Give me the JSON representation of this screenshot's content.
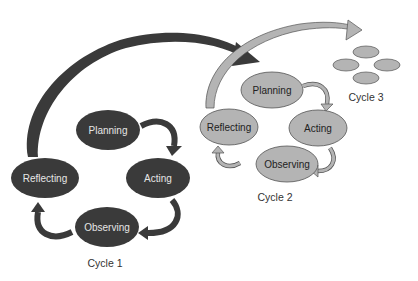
{
  "diagram": {
    "type": "action-research-spiral",
    "colors": {
      "dark_fill": "#3a3a3a",
      "dark_text": "#e6e6e6",
      "light_fill": "#b4b4b4",
      "light_stroke": "#555555",
      "light_text": "#222222",
      "arrow_dark": "#3a3a3a",
      "arrow_light": "#b4b4b4"
    },
    "cycles": [
      {
        "label": "Cycle 1",
        "stages": [
          "Planning",
          "Acting",
          "Observing",
          "Reflecting"
        ]
      },
      {
        "label": "Cycle 2",
        "stages": [
          "Planning",
          "Acting",
          "Observing",
          "Reflecting"
        ]
      },
      {
        "label": "Cycle 3",
        "stages": [
          "",
          "",
          "",
          ""
        ]
      }
    ],
    "connections": [
      {
        "from": "Cycle 1 Reflecting",
        "to": "Cycle 2 Planning"
      },
      {
        "from": "Cycle 2 Reflecting",
        "to": "Cycle 3"
      }
    ]
  }
}
